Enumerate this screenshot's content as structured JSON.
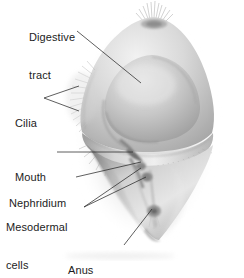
{
  "figure": {
    "name": "trochophore-larva-diagram",
    "style": "grayscale-airbrush-illustration",
    "background_color": "#ffffff",
    "ink_color": "#1c1c1c",
    "body_tones": {
      "highlight": "#efefef",
      "light": "#dcdcdc",
      "mid": "#c2c2c2",
      "shadow": "#9a9a9a",
      "deep_shadow": "#7a7a7a"
    }
  },
  "labels": [
    {
      "id": "digestive-tract",
      "text_line1": "Digestive",
      "text_line2": "tract",
      "x": 29,
      "y": 6,
      "leader": [
        [
          77,
          31
        ],
        [
          141,
          83
        ]
      ]
    },
    {
      "id": "cilia",
      "text_line1": "Cilia",
      "text_line2": "",
      "x": 15,
      "y": 92,
      "leader": [
        [
          44,
          98
        ],
        [
          79,
          86
        ]
      ],
      "leader2": [
        [
          44,
          98
        ],
        [
          79,
          111
        ]
      ]
    },
    {
      "id": "mouth",
      "text_line1": "Mouth",
      "text_line2": "",
      "x": 15,
      "y": 146,
      "leader": [
        [
          57,
          152
        ],
        [
          133,
          152
        ]
      ]
    },
    {
      "id": "nephridium",
      "text_line1": "Nephridium",
      "text_line2": "",
      "x": 9,
      "y": 172,
      "leader": [
        [
          76,
          177
        ],
        [
          141,
          162
        ]
      ]
    },
    {
      "id": "mesodermal-cells",
      "text_line1": "Mesodermal",
      "text_line2": "cells",
      "x": 6,
      "y": 196,
      "leader": [
        [
          84,
          207
        ],
        [
          141,
          168
        ]
      ],
      "leader2": [
        [
          84,
          207
        ],
        [
          146,
          176
        ]
      ]
    },
    {
      "id": "anus",
      "text_line1": "Anus",
      "text_line2": "",
      "x": 68,
      "y": 239,
      "leader": [
        [
          124,
          245
        ],
        [
          152,
          208
        ]
      ]
    }
  ],
  "structures": {
    "apical_tuft": "cilia-tuft-at-apex",
    "prototroch": "equatorial-ciliary-band",
    "digestive_tract": "central-dome-gut",
    "mouth": "opening-below-ciliary-band",
    "nephridium": "excretory-organ-left-lower",
    "mesodermal_cells": "paired-cells-lower-interior",
    "anus": "posterior-opening-at-base"
  }
}
